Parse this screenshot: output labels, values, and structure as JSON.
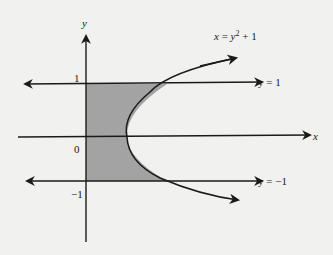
{
  "diagram": {
    "axes": {
      "x_label": "x",
      "y_label": "y"
    },
    "ticks": {
      "y_pos_one": "1",
      "origin": "0",
      "y_neg_one": "−1"
    },
    "curve": {
      "equation_x": "x",
      "equation_eq": " = ",
      "equation_y": "y",
      "equation_exp": "2",
      "equation_rest": " + 1"
    },
    "lines": {
      "upper_label": "y = 1",
      "lower_label": "y = −1"
    },
    "colors": {
      "shade": "#a3a3a3",
      "ink": "#1a1a1a",
      "background": "#f1f1ef"
    }
  }
}
